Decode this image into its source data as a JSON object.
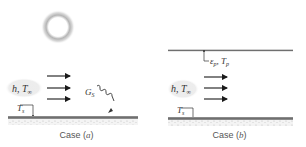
{
  "figure": {
    "colors": {
      "surface_line": "#6f6f6f",
      "surface_fill": "#cfcfcf",
      "arrow": "#1a1a1a",
      "label_text": "#333333",
      "fluid_bubble": "#ebebeb",
      "sun_ring": "#a8a8a8",
      "caption_text": "#555555"
    },
    "case_a": {
      "caption_prefix": "Case (",
      "caption_letter": "a",
      "caption_suffix": ")",
      "sun_icon": "sun-icon",
      "fluid_label": "h, T",
      "fluid_sub": "∞",
      "surface_temp_label": "T",
      "surface_temp_sub": "s",
      "irradiation_label": "G",
      "irradiation_sub": "S",
      "flow_arrows": 3
    },
    "case_b": {
      "caption_prefix": "Case (",
      "caption_letter": "b",
      "caption_suffix": ")",
      "plate_label_eps": "ε",
      "plate_label_eps_sub": "p",
      "plate_label_sep": ", T",
      "plate_label_t_sub": "p",
      "fluid_label": "h, T",
      "fluid_sub": "∞",
      "surface_temp_label": "T",
      "surface_temp_sub": "s",
      "flow_arrows": 3
    }
  }
}
